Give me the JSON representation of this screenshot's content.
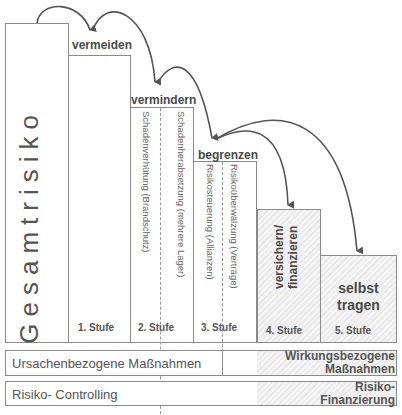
{
  "diagram": {
    "main_label": "Gesamtrisiko",
    "steps": [
      {
        "title": "vermeiden",
        "stufe": "1. Stufe"
      },
      {
        "title": "vermindern",
        "stufe": "2. Stufe",
        "details": [
          "Schadenverhütung (Brandschutz)",
          "Schadenherabsetzung (mehrere Lager)"
        ]
      },
      {
        "title": "begrenzen",
        "stufe": "3. Stufe",
        "details": [
          "Risikosteuerung (Allianzen)",
          "Risikoüberwälzung (Verträge)"
        ]
      },
      {
        "title_lines": [
          "versichern/",
          "finanzieren"
        ],
        "stufe": "4. Stufe"
      },
      {
        "title_lines": [
          "selbst",
          "tragen"
        ],
        "stufe": "5. Stufe"
      }
    ],
    "bars": {
      "measures": {
        "left": "Ursachenbezogene Maßnahmen",
        "right_lines": [
          "Wirkungsbezogene",
          "Maßnahmen"
        ]
      },
      "controlling": {
        "left": "Risiko- Controlling",
        "right_lines": [
          "Risiko-",
          "Finanzierung"
        ]
      }
    },
    "colors": {
      "line": "#8a8a8a",
      "arrow": "#555555",
      "hatch": "#ebebeb"
    }
  }
}
